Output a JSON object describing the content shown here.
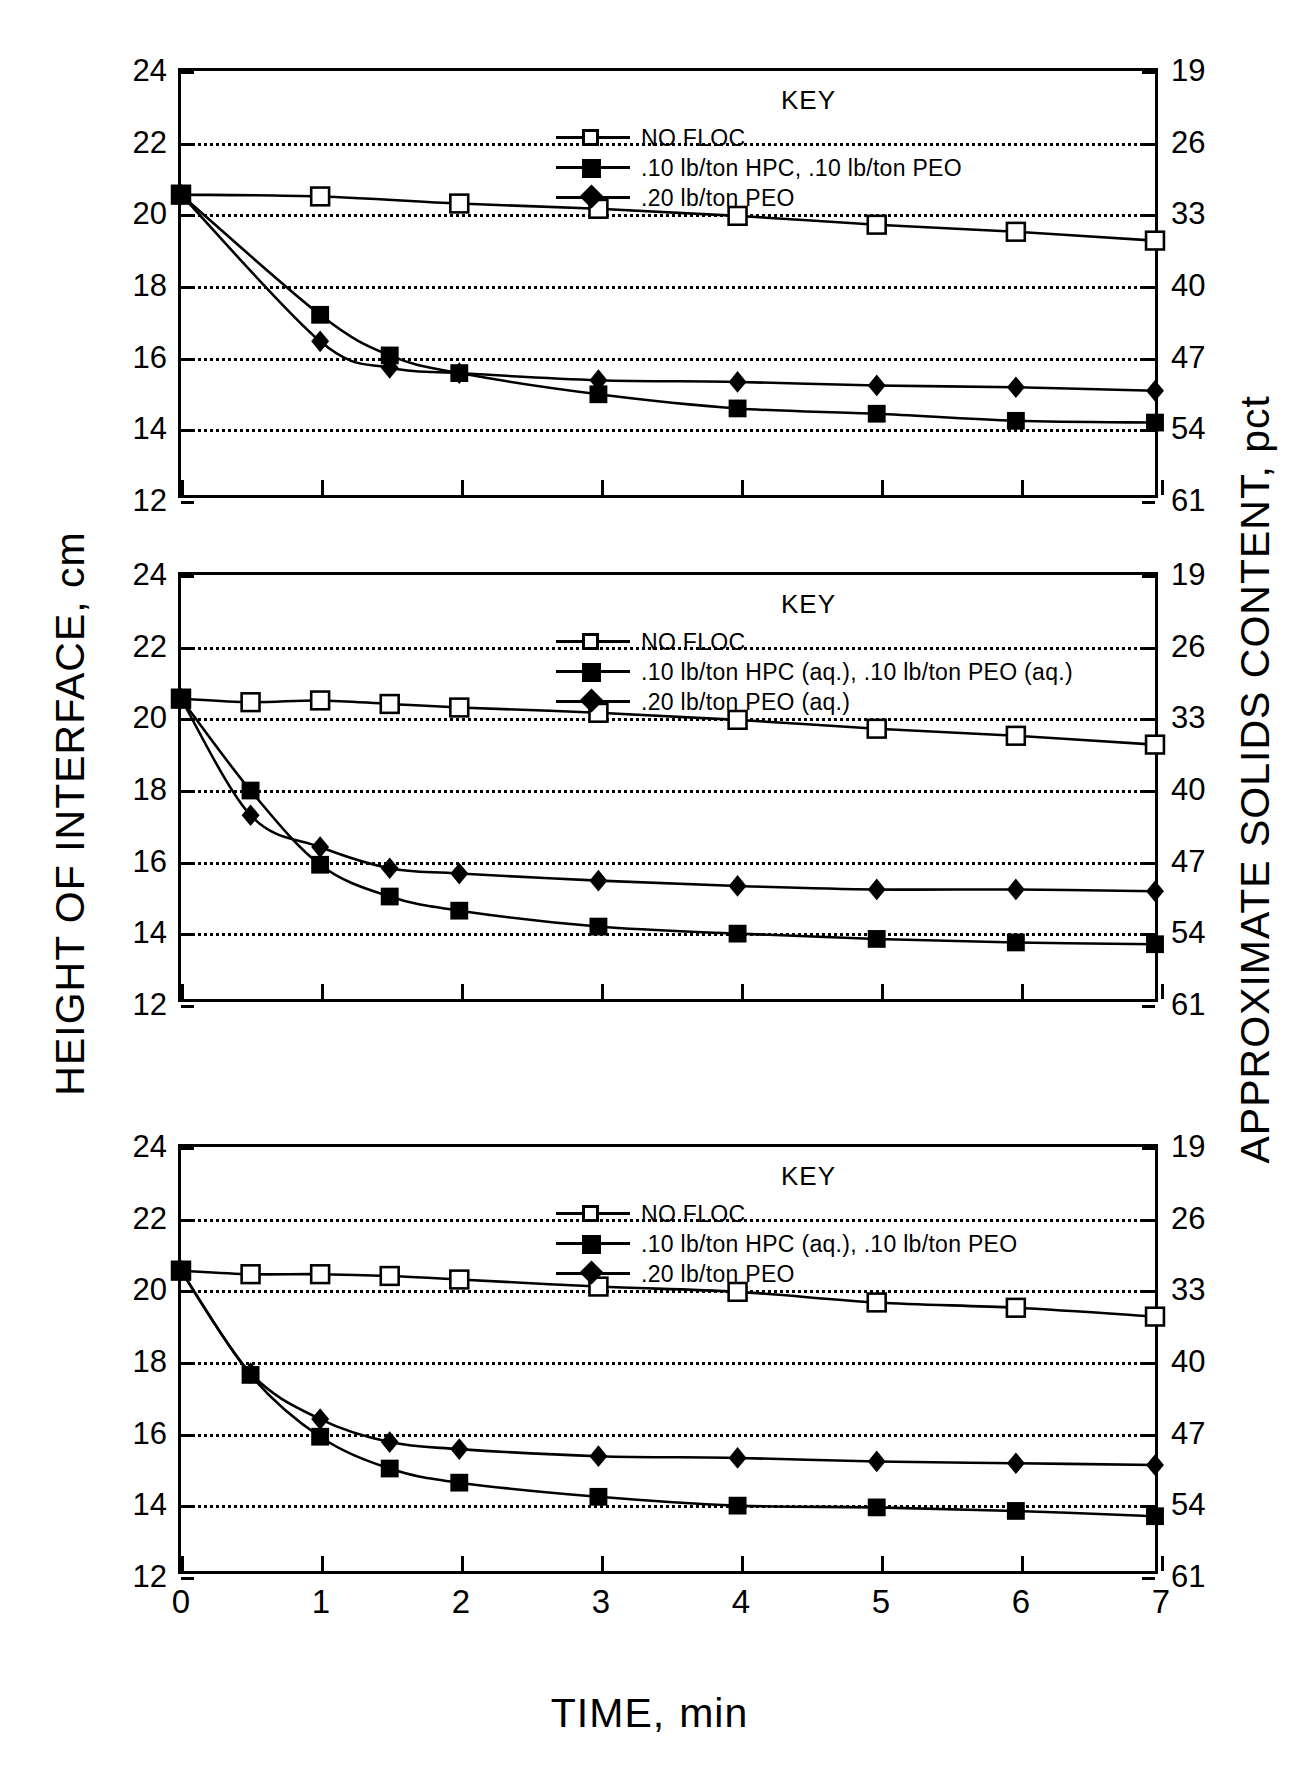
{
  "axes": {
    "left_title": "HEIGHT OF INTERFACE, cm",
    "right_title": "APPROXIMATE SOLIDS CONTENT, pct",
    "x_title": "TIME,",
    "x_unit": "min",
    "y_ticks": [
      "12",
      "14",
      "16",
      "18",
      "20",
      "22",
      "24"
    ],
    "y2_ticks": [
      "61",
      "54",
      "47",
      "40",
      "33",
      "26",
      "19"
    ],
    "x_ticks": [
      "0",
      "1",
      "2",
      "3",
      "4",
      "5",
      "6",
      "7"
    ]
  },
  "key_title": "KEY",
  "chart_data": [
    {
      "type": "line",
      "title": "",
      "xlabel": "TIME, min",
      "ylabel": "HEIGHT OF INTERFACE, cm",
      "y2label": "APPROXIMATE SOLIDS CONTENT, pct",
      "xlim": [
        0,
        7
      ],
      "ylim": [
        12,
        24
      ],
      "y2lim": [
        61,
        19
      ],
      "grid": true,
      "legend_position": "upper-right",
      "series": [
        {
          "name": "NO FLOC",
          "marker": "open-square",
          "x": [
            0,
            1,
            2,
            3,
            4,
            5,
            6,
            7
          ],
          "y": [
            20.5,
            20.45,
            20.25,
            20.1,
            19.9,
            19.65,
            19.45,
            19.2
          ]
        },
        {
          "name": ".10 lb/ton HPC, .10 lb/ton PEO",
          "marker": "filled-square",
          "x": [
            0,
            1,
            1.5,
            2,
            3,
            4,
            5,
            6,
            7
          ],
          "y": [
            20.5,
            17.1,
            15.95,
            15.45,
            14.85,
            14.45,
            14.3,
            14.1,
            14.05
          ]
        },
        {
          "name": ".20 lb/ton PEO",
          "marker": "filled-diamond",
          "x": [
            0,
            1,
            1.5,
            2,
            3,
            4,
            5,
            6,
            7
          ],
          "y": [
            20.5,
            16.35,
            15.6,
            15.45,
            15.25,
            15.2,
            15.1,
            15.05,
            14.95
          ]
        }
      ]
    },
    {
      "type": "line",
      "title": "",
      "xlabel": "TIME, min",
      "ylabel": "HEIGHT OF INTERFACE, cm",
      "y2label": "APPROXIMATE SOLIDS CONTENT, pct",
      "xlim": [
        0,
        7
      ],
      "ylim": [
        12,
        24
      ],
      "y2lim": [
        61,
        19
      ],
      "grid": true,
      "legend_position": "upper-right",
      "series": [
        {
          "name": "NO FLOC",
          "marker": "open-square",
          "x": [
            0,
            0.5,
            1,
            1.5,
            2,
            3,
            4,
            5,
            6,
            7
          ],
          "y": [
            20.5,
            20.4,
            20.45,
            20.35,
            20.25,
            20.1,
            19.9,
            19.65,
            19.45,
            19.2
          ]
        },
        {
          "name": ".10 lb/ton HPC (aq.), .10 lb/ton PEO (aq.)",
          "marker": "filled-square",
          "x": [
            0,
            0.5,
            1,
            1.5,
            2,
            3,
            4,
            5,
            6,
            7
          ],
          "y": [
            20.5,
            17.9,
            15.8,
            14.9,
            14.5,
            14.05,
            13.85,
            13.7,
            13.6,
            13.55
          ]
        },
        {
          "name": ".20 lb/ton PEO (aq.)",
          "marker": "filled-diamond",
          "x": [
            0,
            0.5,
            1,
            1.5,
            2,
            3,
            4,
            5,
            6,
            7
          ],
          "y": [
            20.5,
            17.2,
            16.3,
            15.7,
            15.55,
            15.35,
            15.2,
            15.1,
            15.1,
            15.05
          ]
        }
      ]
    },
    {
      "type": "line",
      "title": "",
      "xlabel": "TIME, min",
      "ylabel": "HEIGHT OF INTERFACE, cm",
      "y2label": "APPROXIMATE SOLIDS CONTENT, pct",
      "xlim": [
        0,
        7
      ],
      "ylim": [
        12,
        24
      ],
      "y2lim": [
        61,
        19
      ],
      "grid": true,
      "legend_position": "upper-right",
      "series": [
        {
          "name": "NO FLOC",
          "marker": "open-square",
          "x": [
            0,
            0.5,
            1,
            1.5,
            2,
            3,
            4,
            5,
            6,
            7
          ],
          "y": [
            20.5,
            20.4,
            20.4,
            20.35,
            20.25,
            20.05,
            19.9,
            19.6,
            19.45,
            19.2
          ]
        },
        {
          "name": ".10 lb/ton HPC (aq.), .10 lb/ton PEO",
          "marker": "filled-square",
          "x": [
            0,
            0.5,
            1,
            1.5,
            2,
            3,
            4,
            5,
            6,
            7
          ],
          "y": [
            20.5,
            17.55,
            15.8,
            14.9,
            14.5,
            14.1,
            13.85,
            13.8,
            13.7,
            13.55
          ]
        },
        {
          "name": ".20 lb/ton PEO",
          "marker": "filled-diamond",
          "x": [
            0,
            0.5,
            1,
            1.5,
            2,
            3,
            4,
            5,
            6,
            7
          ],
          "y": [
            20.5,
            17.6,
            16.3,
            15.65,
            15.45,
            15.25,
            15.2,
            15.1,
            15.05,
            15.0
          ]
        }
      ]
    }
  ]
}
